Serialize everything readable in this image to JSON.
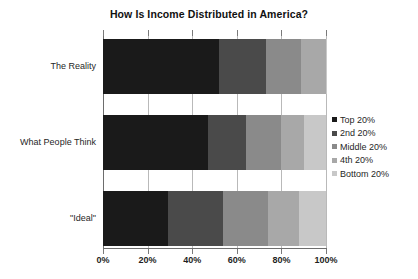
{
  "chart_data": {
    "type": "bar",
    "orientation": "horizontal",
    "stacked": true,
    "normalized_percent": true,
    "title": "How Is Income Distributed in America?",
    "xlabel": "",
    "ylabel": "",
    "xlim": [
      0,
      100
    ],
    "grid": true,
    "legend_position": "right",
    "categories": [
      "The Reality",
      "What People Think",
      "\"Ideal\""
    ],
    "xticks": [
      0,
      20,
      40,
      60,
      80,
      100
    ],
    "xtick_labels": [
      "0%",
      "20%",
      "40%",
      "60%",
      "80%",
      "100%"
    ],
    "series": [
      {
        "name": "Top 20%",
        "color": "#1a1a1a",
        "values": [
          52,
          47,
          29
        ]
      },
      {
        "name": "2nd 20%",
        "color": "#4a4a4a",
        "values": [
          21,
          17,
          25
        ]
      },
      {
        "name": "Middle 20%",
        "color": "#8a8a8a",
        "values": [
          16,
          16,
          20
        ]
      },
      {
        "name": "4th 20%",
        "color": "#a8a8a8",
        "values": [
          11,
          10,
          14
        ]
      },
      {
        "name": "Bottom 20%",
        "color": "#c8c8c8",
        "values": [
          0.2,
          10,
          12
        ]
      }
    ]
  },
  "colors": {
    "axis": "#6d6d6d",
    "gridline": "#b9b9b9",
    "text": "#1f1f1f",
    "background": "#ffffff"
  }
}
